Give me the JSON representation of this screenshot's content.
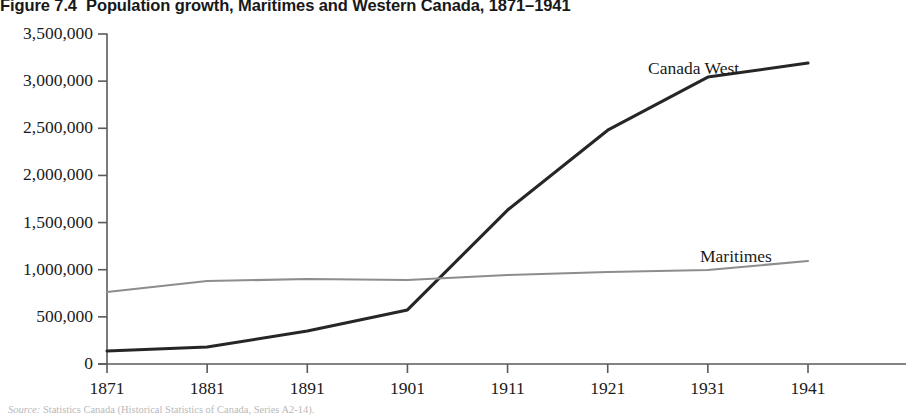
{
  "figure": {
    "number_label": "Figure 7.4",
    "title": "Population growth, Maritimes and Western Canada, 1871–1941",
    "source_lead": "Source:",
    "source_text": "Statistics Canada (Historical Statistics of Canada, Series A2-14)."
  },
  "annotations": [
    {
      "name": "canada-west-label",
      "text": "Canada West",
      "x": 648,
      "y": 58
    },
    {
      "name": "maritimes-label",
      "text": "Maritimes",
      "x": 700,
      "y": 246
    }
  ],
  "axes": {
    "x_axis_title": "",
    "y_axis_title": "",
    "x_tick_labels": [
      "1871",
      "1881",
      "1891",
      "1901",
      "1911",
      "1921",
      "1931",
      "1941"
    ],
    "y_tick_labels": [
      "0",
      "500,000",
      "1,000,000",
      "1,500,000",
      "2,000,000",
      "2,500,000",
      "3,000,000",
      "3,500,000"
    ]
  },
  "colors": {
    "canada_west_line": "#262626",
    "maritimes_line": "#8d8d8d",
    "axis": "#5a5a5a",
    "text": "#1a1a1a",
    "background": "#ffffff"
  },
  "chart_data": {
    "type": "line",
    "title": "Population growth, Maritimes and Western Canada, 1871–1941",
    "xlabel": "",
    "ylabel": "",
    "x": [
      1871,
      1881,
      1891,
      1901,
      1911,
      1921,
      1931,
      1941
    ],
    "categories": [
      "1871",
      "1881",
      "1891",
      "1901",
      "1911",
      "1921",
      "1931",
      "1941"
    ],
    "series": [
      {
        "name": "Canada West",
        "color": "#262626",
        "line_width": 3.1,
        "values": [
          138000,
          180000,
          350000,
          573000,
          1633000,
          2480000,
          3043000,
          3192000
        ]
      },
      {
        "name": "Maritimes",
        "color": "#8d8d8d",
        "line_width": 2.1,
        "values": [
          764000,
          880000,
          901000,
          891000,
          944000,
          976000,
          997000,
          1092000
        ]
      }
    ],
    "xlim": [
      1871,
      1941
    ],
    "ylim": [
      0,
      3500000
    ],
    "y_tick_step": 500000,
    "grid": false,
    "legend": "none-inline-annotations"
  },
  "_plot_geometry": {
    "x_left_px": 107,
    "x_right_px": 808,
    "y_zero_px": 364,
    "y_top_px": 34
  }
}
